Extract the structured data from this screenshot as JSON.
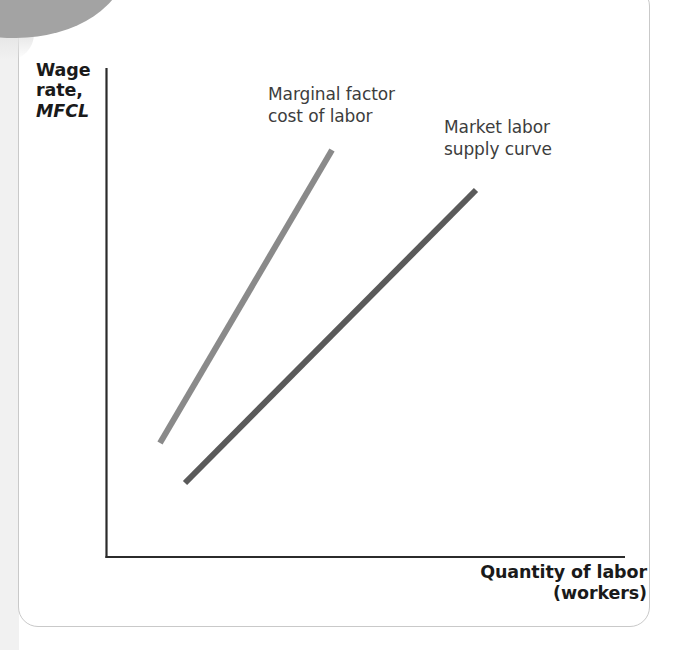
{
  "figure": {
    "card_background": "#ffffff",
    "card_border_color": "#c9c9c9",
    "corner_tab_color": "#a3a3a3"
  },
  "axes": {
    "y_label_line1": "Wage",
    "y_label_line2": "rate,",
    "y_label_line3": "MFCL",
    "x_label_line1": "Quantity of labor",
    "x_label_line2": "(workers)",
    "axis_color": "#2b2b2b"
  },
  "labels": {
    "mfc_line1": "Marginal factor",
    "mfc_line2": "cost of labor",
    "supply_line1": "Market labor",
    "supply_line2": "supply curve"
  },
  "chart_data": {
    "type": "line",
    "title": "",
    "xlabel": "Quantity of labor (workers)",
    "ylabel": "Wage rate, MFCL",
    "grid": false,
    "legend": "inline-annotations",
    "xlim": [
      0,
      100
    ],
    "ylim": [
      0,
      100
    ],
    "series": [
      {
        "name": "Marginal factor cost of labor",
        "color": "#8a8a8a",
        "label_text": "Marginal factor cost of labor",
        "x": [
          10.4,
          43.6
        ],
        "y": [
          23.5,
          83.3
        ],
        "pixel_start": [
          160,
          443
        ],
        "pixel_end": [
          332,
          150
        ],
        "stroke_width": 6,
        "slope_note": "steeper than market labor supply curve"
      },
      {
        "name": "Market labor supply curve",
        "color": "#5a5a5a",
        "label_text": "Market labor supply curve",
        "x": [
          15.2,
          56.1
        ],
        "y": [
          15.3,
          75.1
        ],
        "pixel_start": [
          185,
          483
        ],
        "pixel_end": [
          476,
          190
        ],
        "stroke_width": 6,
        "slope_note": "flatter, lies below and to the right of MFC"
      }
    ]
  }
}
